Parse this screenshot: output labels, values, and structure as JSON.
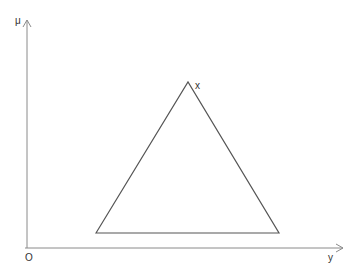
{
  "diagram": {
    "type": "triangular membership function",
    "axes": {
      "y_axis_label": "μ",
      "x_axis_label": "y",
      "origin_label": "O"
    },
    "shape": {
      "name": "triangle",
      "apex_label": "x",
      "vertices": {
        "left_base": [
          96,
          233
        ],
        "apex": [
          188,
          82
        ],
        "right_base": [
          279,
          233
        ]
      }
    },
    "colors": {
      "axis": "#888888",
      "shape": "#555555",
      "text": "#333333"
    }
  }
}
